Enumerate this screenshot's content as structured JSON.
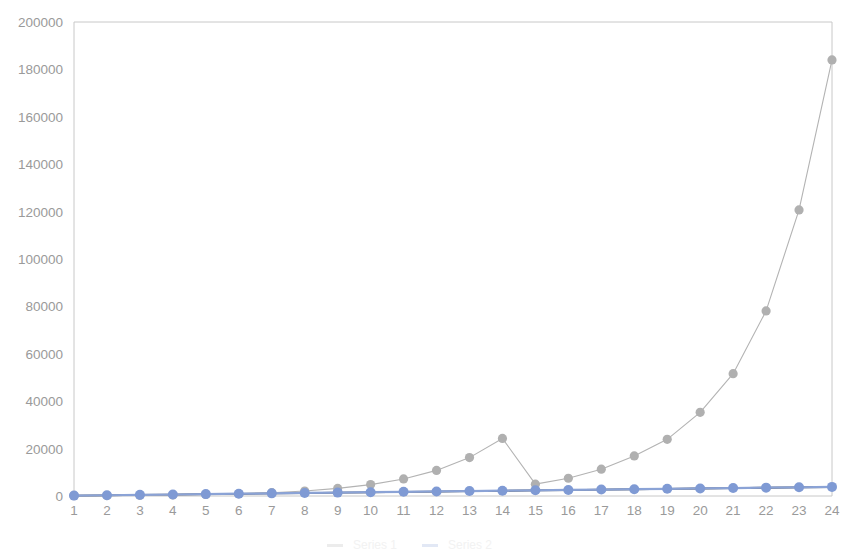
{
  "chart_data": {
    "type": "line",
    "title": "",
    "subtitle": "",
    "xlabel": "",
    "ylabel": "",
    "xlim": [
      1,
      24
    ],
    "ylim": [
      0,
      200000
    ],
    "grid": false,
    "legend_position": "bottom",
    "x": [
      1,
      2,
      3,
      4,
      5,
      6,
      7,
      8,
      9,
      10,
      11,
      12,
      13,
      14,
      15,
      16,
      17,
      18,
      19,
      20,
      21,
      22,
      23,
      24
    ],
    "categories": [
      "1",
      "2",
      "3",
      "4",
      "5",
      "6",
      "7",
      "8",
      "9",
      "10",
      "11",
      "12",
      "13",
      "14",
      "15",
      "16",
      "17",
      "18",
      "19",
      "20",
      "21",
      "22",
      "23",
      "24"
    ],
    "ytick_labels": [
      "0",
      "20000",
      "40000",
      "60000",
      "80000",
      "100000",
      "120000",
      "140000",
      "160000",
      "180000",
      "200000"
    ],
    "ytick_values": [
      0,
      20000,
      40000,
      60000,
      80000,
      100000,
      120000,
      140000,
      160000,
      180000,
      200000
    ],
    "series": [
      {
        "name": "exponential",
        "color": "#b3b3b3",
        "marker_color": "#b0b0b0",
        "line_width": 1.1,
        "marker_size": 4.6,
        "values": [
          120,
          180,
          280,
          420,
          640,
          950,
          1400,
          2100,
          3200,
          4800,
          7200,
          10800,
          16200,
          24300,
          5000,
          7500,
          11300,
          16900,
          23900,
          35300,
          51600,
          78100,
          120700,
          184000
        ]
      },
      {
        "name": "linear",
        "color": "#8ba3d6",
        "marker_color": "#7f9ad4",
        "line_width": 2.2,
        "marker_size": 5.0,
        "values": [
          160,
          320,
          480,
          640,
          800,
          960,
          1120,
          1280,
          1440,
          1600,
          1760,
          1920,
          2080,
          2240,
          2400,
          2560,
          2720,
          2880,
          3040,
          3200,
          3360,
          3520,
          3680,
          3840
        ]
      },
      {
        "name": "baseline-dark",
        "color": "#3a3a3a",
        "marker_color": "#3a3a3a",
        "line_width": 1.8,
        "marker_size": 0,
        "values": [
          120,
          280,
          440,
          600,
          760,
          920,
          1080,
          1240,
          1400,
          1560,
          1720,
          1880,
          2040,
          2200,
          2360,
          2520,
          2680,
          2840,
          3000,
          3160,
          3320,
          3480,
          3640,
          3800
        ]
      }
    ],
    "legend_entries": [
      "Series 1",
      "Series 2"
    ],
    "axis_color": "#c8c8c8",
    "tick_label_color": "#9a9a9a",
    "background_color": "#ffffff"
  },
  "plot_geometry": {
    "left": 74,
    "right": 832,
    "top": 22,
    "bottom": 496
  }
}
